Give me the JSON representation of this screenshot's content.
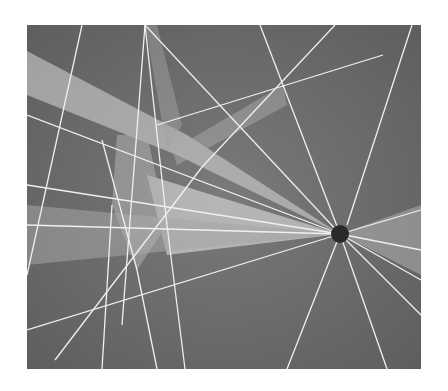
{
  "image": {
    "description": "Grayscale abstract drawing of white light rays radiating from a dark circular point on a gray background",
    "colors": {
      "background": "#ffffff",
      "canvas": "#6e6e6e",
      "ray": "#f2f2f2",
      "beam": "#d8d8d8",
      "focal_point": "#2a2a2a"
    },
    "focal_point": {
      "cx": 313,
      "cy": 209,
      "r": 9
    }
  }
}
